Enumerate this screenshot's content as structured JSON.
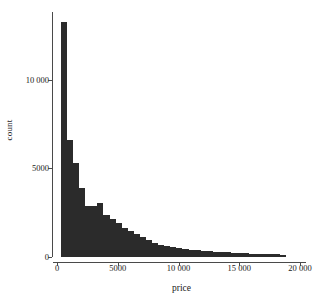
{
  "chart_data": {
    "type": "bar",
    "title": "",
    "subtitle": "",
    "xlabel": "price",
    "ylabel": "count",
    "xlim": [
      0,
      20000
    ],
    "ylim": [
      0,
      13500
    ],
    "grid": false,
    "legend": null,
    "bin_width": 500,
    "bar_color": "#2b2b2b",
    "axis_color": "#4a4a4a",
    "xticks": [
      0,
      5000,
      10000,
      15000,
      20000
    ],
    "xtick_labels": [
      "0",
      "5000",
      "10 000",
      "15 000",
      "20 000"
    ],
    "yticks": [
      0,
      5000,
      10000
    ],
    "ytick_labels": [
      "0",
      "5000",
      "10 000"
    ],
    "bin_starts": [
      326,
      826,
      1326,
      1826,
      2326,
      2826,
      3326,
      3826,
      4326,
      4826,
      5326,
      5826,
      6326,
      6826,
      7326,
      7826,
      8326,
      8826,
      9326,
      9826,
      10326,
      10826,
      11326,
      11826,
      12326,
      12826,
      13326,
      13826,
      14326,
      14826,
      15326,
      15826,
      16326,
      16826,
      17326,
      17826,
      18326
    ],
    "values": [
      13300,
      6600,
      5300,
      3900,
      2900,
      2900,
      3050,
      2400,
      2150,
      1900,
      1650,
      1450,
      1300,
      1150,
      950,
      800,
      700,
      620,
      560,
      500,
      450,
      410,
      380,
      350,
      320,
      300,
      280,
      260,
      240,
      225,
      210,
      195,
      180,
      170,
      160,
      150,
      120
    ],
    "categories": [
      "326",
      "826",
      "1326",
      "1826",
      "2326",
      "2826",
      "3326",
      "3826",
      "4326",
      "4826",
      "5326",
      "5826",
      "6326",
      "6826",
      "7326",
      "7826",
      "8326",
      "8826",
      "9326",
      "9826",
      "10326",
      "10826",
      "11326",
      "11826",
      "12326",
      "12826",
      "13326",
      "13826",
      "14326",
      "14826",
      "15326",
      "15826",
      "16326",
      "16826",
      "17326",
      "17826",
      "18326"
    ]
  }
}
